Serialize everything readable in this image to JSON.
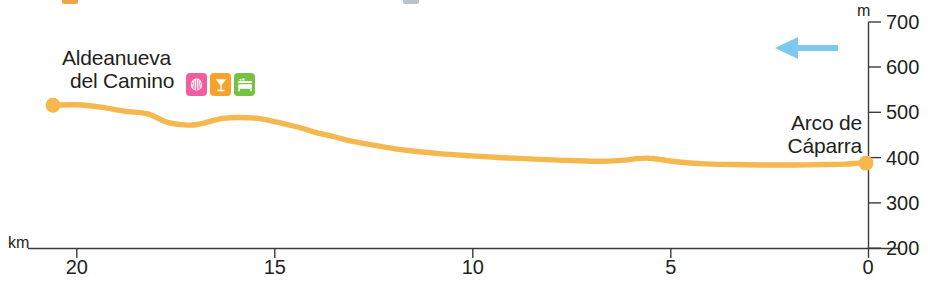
{
  "chart_data": {
    "type": "area",
    "title": "",
    "subtitle": "",
    "xlabel": "km",
    "ylabel": "m",
    "xlim": [
      20.6,
      0
    ],
    "ylim": [
      200,
      700
    ],
    "x_reversed": true,
    "grid": false,
    "legend": "none",
    "x_ticks": [
      20,
      15,
      10,
      5,
      0
    ],
    "y_ticks": [
      200,
      300,
      400,
      500,
      600,
      700
    ],
    "x_axis_unit": "km",
    "y_axis_unit": "m",
    "zero_label": "0",
    "line_color": "#f5b84f",
    "series_name": "elevation-profile",
    "x": [
      20.6,
      20.0,
      19.4,
      18.8,
      18.2,
      17.7,
      17.2,
      16.9,
      16.6,
      16.3,
      15.9,
      15.4,
      14.9,
      14.4,
      14.0,
      13.5,
      13.0,
      12.3,
      11.6,
      10.8,
      10.0,
      9.2,
      8.4,
      7.6,
      6.8,
      6.2,
      5.8,
      5.5,
      5.2,
      4.8,
      4.2,
      3.4,
      2.6,
      1.8,
      1.0,
      0.5,
      0.2,
      0.0
    ],
    "y": [
      516,
      517,
      512,
      503,
      497,
      478,
      472,
      474,
      481,
      487,
      489,
      487,
      478,
      468,
      457,
      447,
      436,
      425,
      416,
      409,
      404,
      400,
      397,
      394,
      392,
      394,
      398,
      399,
      396,
      391,
      387,
      385,
      384,
      384,
      385,
      386,
      388,
      388
    ],
    "annotations": [
      {
        "name": "start-waypoint",
        "label": "Aldeanueva del Camino",
        "label_lines": [
          "Aldeanueva",
          "del Camino"
        ],
        "km": 20.6,
        "elevation_m": 516,
        "marker": "dot",
        "marker_color": "#f5b84f",
        "pois": [
          {
            "name": "pilgrim-shell-icon",
            "label": "shell",
            "color": "#ef5fa0"
          },
          {
            "name": "restaurant-icon",
            "label": "bar-restaurant",
            "color": "#f6a22c"
          },
          {
            "name": "accommodation-icon",
            "label": "lodging",
            "color": "#76c043"
          }
        ]
      },
      {
        "name": "end-waypoint",
        "label": "Arco de Cáparra",
        "label_lines": [
          "Arco de",
          "Cáparra"
        ],
        "km": 0.0,
        "elevation_m": 388,
        "marker": "dot",
        "marker_color": "#f5b84f",
        "pois": []
      },
      {
        "name": "direction-arrow",
        "label": "travel direction",
        "direction": "left",
        "color": "#7cc8ef"
      }
    ]
  },
  "axis": {
    "x_unit": "km",
    "y_unit": "m",
    "zero": "0",
    "x_tick_labels": [
      "20",
      "15",
      "10",
      "5",
      "0"
    ],
    "y_tick_labels": [
      "200",
      "300",
      "400",
      "500",
      "600",
      "700"
    ]
  },
  "labels": {
    "left_place_line1": "Aldeanueva",
    "left_place_line2": "del Camino",
    "right_place_line1": "Arco de",
    "right_place_line2": "Cáparra"
  },
  "colors": {
    "profile_line": "#f5b84f",
    "profile_fill": "#ffffff",
    "arrow": "#7cc8ef",
    "axis": "#3b3b3b",
    "text": "#231f20",
    "poi_shell": "#ef5fa0",
    "poi_restaurant": "#f6a22c",
    "poi_lodging": "#76c043"
  }
}
